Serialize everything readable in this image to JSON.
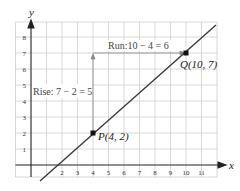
{
  "diagram": {
    "axes": {
      "x_label": "x",
      "y_label": "y",
      "x_ticks": [
        "2",
        "3",
        "4",
        "5",
        "6",
        "7",
        "8",
        "9",
        "10",
        "11"
      ],
      "y_ticks": [
        "1",
        "2",
        "3",
        "4",
        "5",
        "6",
        "7",
        "8"
      ]
    },
    "points": {
      "P": {
        "label": "P(4, 2)",
        "x": 4,
        "y": 2
      },
      "Q": {
        "label": "Q(10, 7)",
        "x": 10,
        "y": 7
      }
    },
    "annotations": {
      "rise": "Rise: 7 − 2 = 5",
      "run": "Run:10 − 4 = 6"
    },
    "colors": {
      "grid": "#cccccc",
      "axis": "#222222",
      "line": "#3a3a3a",
      "arrow": "#888888"
    }
  }
}
